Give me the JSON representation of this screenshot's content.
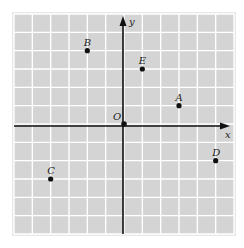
{
  "figure": {
    "type": "coordinate-plane",
    "background_color": "#d4d4d4",
    "gridline_color": "#ffffff",
    "axis_color": "#111111",
    "point_color": "#111111",
    "x_range": [
      -6,
      6
    ],
    "y_range": [
      -6,
      6
    ],
    "axis_labels": {
      "x": "x",
      "y": "y"
    },
    "origin_label": "O"
  },
  "chart_data": {
    "type": "scatter",
    "title": "",
    "xlabel": "x",
    "ylabel": "y",
    "xlim": [
      -6,
      6
    ],
    "ylim": [
      -6,
      6
    ],
    "grid": true,
    "points": [
      {
        "label": "A",
        "x": 3,
        "y": 1
      },
      {
        "label": "B",
        "x": -2,
        "y": 4
      },
      {
        "label": "C",
        "x": -4,
        "y": -3
      },
      {
        "label": "D",
        "x": 5,
        "y": -2
      },
      {
        "label": "E",
        "x": 1,
        "y": 3
      },
      {
        "label": "O",
        "x": 0,
        "y": 0
      }
    ]
  }
}
